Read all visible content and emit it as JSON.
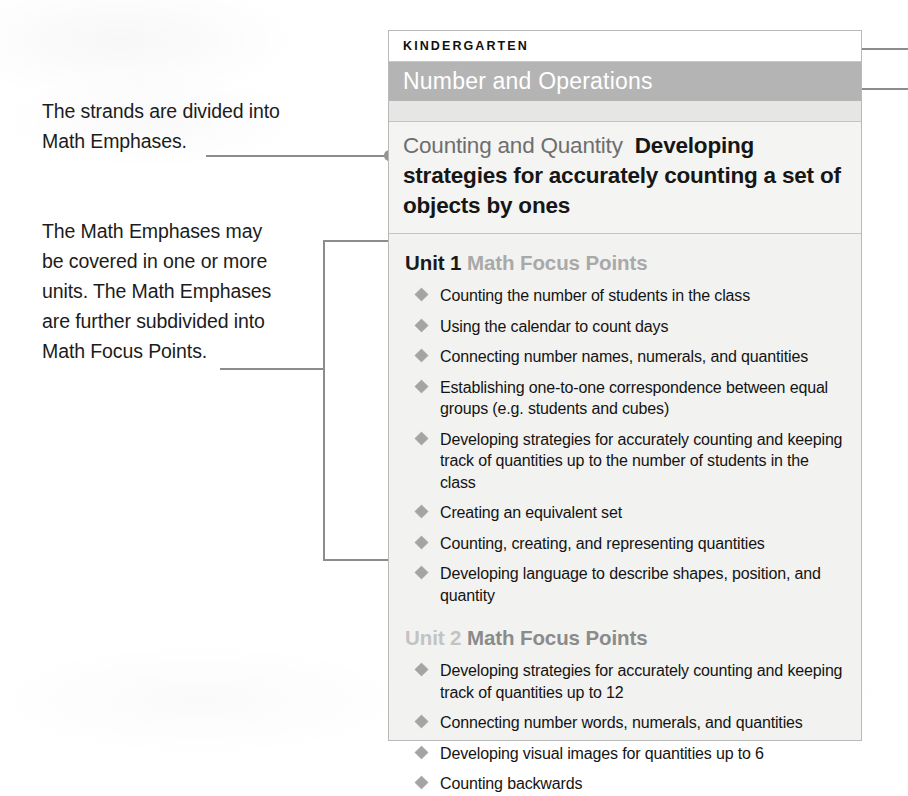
{
  "annotations": [
    {
      "id": "strands-note",
      "text": "The strands are divided into\nMath Emphases."
    },
    {
      "id": "emphases-note",
      "text": "The Math Emphases may\nbe covered in one or more\nunits. The Math Emphases\nare further subdivided into\nMath Focus Points."
    }
  ],
  "panel": {
    "grade_label": "KINDERGARTEN",
    "strand_label": "Number and Operations",
    "emphasis": {
      "title": "Counting and Quantity",
      "description": "Developing strategies for accurately counting a set of objects by ones"
    },
    "units": [
      {
        "number_label": "Unit 1",
        "focus_label": "Math Focus Points",
        "focus_points": [
          "Counting the number of students in the class",
          "Using the calendar to count days",
          "Connecting number names, numerals, and quantities",
          "Establishing one-to-one correspondence between equal groups (e.g. students and cubes)",
          "Developing strategies for accurately counting and keeping track of quantities up to the number of students in the class",
          "Creating an equivalent set",
          "Counting, creating, and representing quantities",
          "Developing language to describe shapes, position, and quantity"
        ]
      },
      {
        "number_label": "Unit 2",
        "focus_label": "Math Focus Points",
        "focus_points": [
          "Developing strategies for accurately counting and keeping track of quantities up to 12",
          "Connecting number words, numerals, and quantities",
          "Developing visual images for quantities up to 6",
          "Counting backwards"
        ]
      }
    ]
  },
  "colors": {
    "strand_band": "#b4b4b4",
    "panel_background": "#f2f2f0",
    "panel_border": "#b9b9b9",
    "leader_line": "#8c8c8c",
    "bullet_diamond": "#a4a4a4",
    "emphasis_title": "#6e6e6e",
    "unit2_dim": "#c3c3c3"
  }
}
